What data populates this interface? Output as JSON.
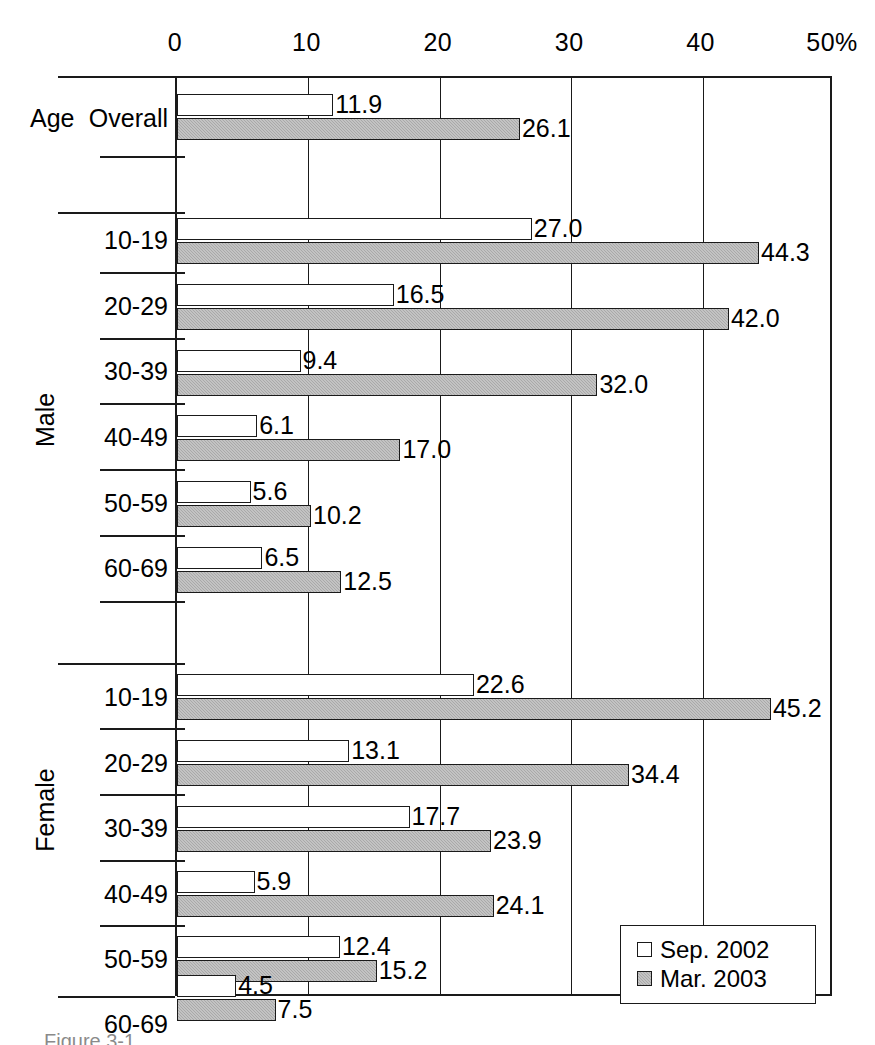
{
  "chart_data": {
    "type": "bar",
    "orientation": "horizontal",
    "title": "",
    "xlabel": "",
    "ylabel": "Age",
    "xlim": [
      0,
      50
    ],
    "xticks": [
      0,
      10,
      20,
      30,
      40,
      50
    ],
    "xtick_labels": [
      "0",
      "10",
      "20",
      "30",
      "40",
      "50%"
    ],
    "x_unit": "%",
    "grid": "vertical",
    "legend_position": "bottom-right",
    "series": [
      {
        "name": "Sep. 2002",
        "key": "sep",
        "swatch": "white-square",
        "values": [
          11.9,
          27.0,
          16.5,
          9.4,
          6.1,
          5.6,
          6.5,
          22.6,
          13.1,
          17.7,
          5.9,
          12.4,
          4.5
        ]
      },
      {
        "name": "Mar. 2003",
        "key": "mar",
        "swatch": "gray-square",
        "values": [
          26.1,
          44.3,
          42.0,
          32.0,
          17.0,
          10.2,
          12.5,
          45.2,
          34.4,
          23.9,
          24.1,
          15.2,
          7.5
        ]
      }
    ],
    "categories": [
      "Overall",
      "10-19",
      "20-29",
      "30-39",
      "40-49",
      "50-59",
      "60-69",
      "10-19",
      "20-29",
      "30-39",
      "40-49",
      "50-59",
      "60-69"
    ],
    "groups": [
      {
        "label": "Age",
        "categories": [
          "Overall"
        ]
      },
      {
        "label": "Male",
        "categories": [
          "10-19",
          "20-29",
          "30-39",
          "40-49",
          "50-59",
          "60-69"
        ]
      },
      {
        "label": "Female",
        "categories": [
          "10-19",
          "20-29",
          "30-39",
          "40-49",
          "50-59",
          "60-69"
        ]
      }
    ],
    "rows": [
      {
        "group": "Age",
        "category": "Overall",
        "sep": 11.9,
        "mar": 26.1
      },
      {
        "group": "Male",
        "category": "10-19",
        "sep": 27.0,
        "mar": 44.3
      },
      {
        "group": "Male",
        "category": "20-29",
        "sep": 16.5,
        "mar": 42.0
      },
      {
        "group": "Male",
        "category": "30-39",
        "sep": 9.4,
        "mar": 32.0
      },
      {
        "group": "Male",
        "category": "40-49",
        "sep": 6.1,
        "mar": 17.0
      },
      {
        "group": "Male",
        "category": "50-59",
        "sep": 5.6,
        "mar": 10.2
      },
      {
        "group": "Male",
        "category": "60-69",
        "sep": 6.5,
        "mar": 12.5
      },
      {
        "group": "Female",
        "category": "10-19",
        "sep": 22.6,
        "mar": 45.2
      },
      {
        "group": "Female",
        "category": "20-29",
        "sep": 13.1,
        "mar": 34.4
      },
      {
        "group": "Female",
        "category": "30-39",
        "sep": 17.7,
        "mar": 23.9
      },
      {
        "group": "Female",
        "category": "40-49",
        "sep": 5.9,
        "mar": 24.1
      },
      {
        "group": "Female",
        "category": "50-59",
        "sep": 12.4,
        "mar": 15.2
      },
      {
        "group": "Female",
        "category": "60-69",
        "sep": 4.5,
        "mar": 7.5
      }
    ]
  },
  "legend": {
    "items": [
      {
        "label": "Sep. 2002",
        "key": "sep"
      },
      {
        "label": "Mar. 2003",
        "key": "mar"
      }
    ]
  },
  "colors": {
    "sep_2002_fill": "#ffffff",
    "mar_2003_fill": "#a9a9a9",
    "line": "#1a1a1a",
    "background": "#ffffff"
  },
  "caption": {
    "text": "Figure 3-1"
  }
}
